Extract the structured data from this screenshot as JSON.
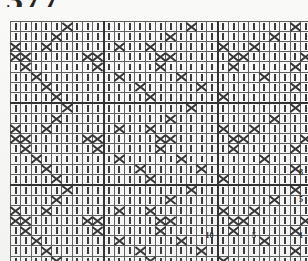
{
  "folio": {
    "top": "377",
    "bottom": "125"
  },
  "colors": {
    "ink": "#2e2e2e",
    "grid_line": "#5d5d5d",
    "grid_line_bold": "#2a2a2a",
    "paper": "#fdfdfc"
  },
  "chart_data": {
    "type": "heatmap",
    "title": "",
    "xlabel": "",
    "ylabel": "",
    "grid": true,
    "legend_position": "none",
    "columns": 31,
    "rows": 24,
    "symbol_legend": [
      {
        "key": "|",
        "name": "dash-stitch"
      },
      {
        "key": "X",
        "name": "cross-stitch"
      },
      {
        "key": ".",
        "name": "blank-cell"
      }
    ],
    "row_tick_labels": [
      {
        "row_from_bottom": 1,
        "label": "1"
      },
      {
        "row_from_bottom": 5,
        "label": "5"
      },
      {
        "row_from_bottom": 8,
        "label": "8"
      }
    ],
    "column_tick_labels": [
      {
        "col_from_right": 5,
        "label": "5"
      },
      {
        "col_from_right": 10,
        "label": "10"
      }
    ],
    "bold_column_separators_from_right": [
      11,
      22
    ],
    "bold_row_separators_from_bottom": [
      8,
      16
    ],
    "cells": [
      "|||||X|||||||||||X|||||||||X|||",
      "||||X||||||||||X|||||||||X|||||",
      "X||X||||||X||X||||||X||X||||||X",
      "XX|||||XX|||||XX|||||XX|||||XX|",
      "|X||||||X|||||X||||||X|||||X|||",
      "||X|||||||X|||||X|||||||X||||||",
      "|||X||||||||X|||||X||||||||X|||",
      "||||X||||||||X||||||X|||||||||X",
      "|||||X|||||||||||X|||||||||X|||",
      "||||X||||||||||X|||||||||X|||||",
      "X||X||||||X||X||||||X||X||||||X",
      "XX|||||XX|||||XX|||||XX|||||XX|",
      "|X||||||X|||||X||||||X|||||X|||",
      "||X|||||||X|||||X|||||||X||||||",
      "|||X||||||||X|||||X||||||||X|||",
      "||||X||||||||X||||||X|||||||||X",
      "|||||X|||||||||||X|||||||||X|||",
      "||||X||||||||||X|||||||||X|||||",
      "X||X||||||X||X||||||X||X||||||X",
      "XX|||||XX|||||XX|||||XX|||||XX|",
      "|X||||||X|||||X||||||X|||||X|||",
      "||X|||||||X|||||X|||||||X||||||",
      "|||X||||||||X|||||X||||||||X|||",
      "||||X||||||||X||||||X|||||||||X"
    ]
  }
}
